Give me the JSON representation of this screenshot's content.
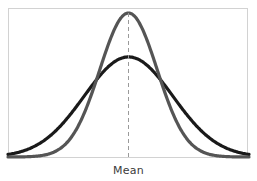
{
  "figure": {
    "background_color": "#ffffff",
    "frame": {
      "border_color": "#d2d2d2",
      "x": 8,
      "y": 8,
      "width": 240,
      "height": 150
    }
  },
  "axis_label": {
    "text": "Mean",
    "color": "#3b3b3b"
  },
  "chart_data": {
    "type": "line",
    "title": "",
    "subtitle": "",
    "xlabel": "Mean",
    "ylabel": "",
    "grid": false,
    "legend": null,
    "annotations": [
      {
        "name": "mean-reference-line",
        "type": "vertical-dashed-line",
        "x": 0,
        "label": "Mean",
        "color": "#9a9a9a",
        "dash": [
          4,
          3
        ],
        "from_y": 0,
        "to_y": 1.0
      }
    ],
    "xlim": [
      -4.2,
      4.2
    ],
    "ylim": [
      0,
      1.0
    ],
    "x": [
      -4.2,
      -3.9,
      -3.6,
      -3.3,
      -3.0,
      -2.7,
      -2.4,
      -2.1,
      -1.8,
      -1.5,
      -1.2,
      -0.9,
      -0.6,
      -0.3,
      0.0,
      0.3,
      0.6,
      0.9,
      1.2,
      1.5,
      1.8,
      2.1,
      2.4,
      2.7,
      3.0,
      3.3,
      3.6,
      3.9,
      4.2
    ],
    "series": [
      {
        "name": "narrow-distribution",
        "color": "#555555",
        "linewidth": 3.2,
        "mean": 0,
        "std_dev": 1.0,
        "peak_value": 1.0,
        "values": [
          0.0001,
          0.0005,
          0.0015,
          0.0042,
          0.0111,
          0.0266,
          0.0561,
          0.1103,
          0.1979,
          0.3247,
          0.4868,
          0.667,
          0.8353,
          0.956,
          1.0,
          0.956,
          0.8353,
          0.667,
          0.4868,
          0.3247,
          0.1979,
          0.1103,
          0.0561,
          0.0266,
          0.0111,
          0.0042,
          0.0015,
          0.0005,
          0.0001
        ]
      },
      {
        "name": "wide-distribution",
        "color": "#1a1a1a",
        "linewidth": 3.2,
        "mean": 0,
        "std_dev": 1.55,
        "peak_value": 0.695,
        "values": [
          0.0173,
          0.0291,
          0.0468,
          0.0722,
          0.1068,
          0.1517,
          0.2069,
          0.271,
          0.3413,
          0.4134,
          0.4819,
          0.5415,
          0.5876,
          0.6169,
          0.695,
          0.6169,
          0.5876,
          0.5415,
          0.4819,
          0.4134,
          0.3413,
          0.271,
          0.2069,
          0.1517,
          0.1068,
          0.0722,
          0.0468,
          0.0291,
          0.0173
        ]
      }
    ],
    "crossings": [
      {
        "x": -1.45,
        "y": 0.44
      },
      {
        "x": 1.45,
        "y": 0.44
      }
    ]
  }
}
